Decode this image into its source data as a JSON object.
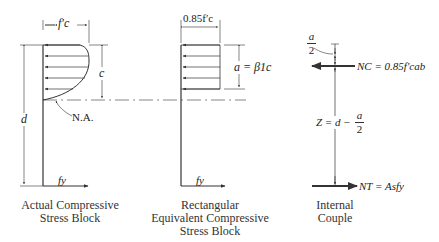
{
  "diagram": {
    "panels": [
      {
        "id": "actual",
        "caption_line1": "Actual Compressive",
        "caption_line2": "Stress Block",
        "width_label": "f′c",
        "depth_label_c": "c",
        "depth_label_d": "d",
        "na_label": "N.A.",
        "steel_label": "fy"
      },
      {
        "id": "rectangular",
        "caption_line1": "Rectangular",
        "caption_line2": "Equivalent Compressive",
        "caption_line3": "Stress Block",
        "width_label": "0.85f′c",
        "depth_label": "a = β1c",
        "steel_label": "fy"
      },
      {
        "id": "couple",
        "caption_line1": "Internal",
        "caption_line2": "Couple",
        "half_a_num": "a",
        "half_a_den": "2",
        "compression_label": "NC = 0.85f′cab",
        "lever_arm_label": "Z = d −",
        "lever_num": "a",
        "lever_den": "2",
        "tension_label": "NT = Asfy"
      }
    ],
    "colors": {
      "line": "#333333",
      "text": "#222222",
      "background": "#ffffff"
    }
  }
}
